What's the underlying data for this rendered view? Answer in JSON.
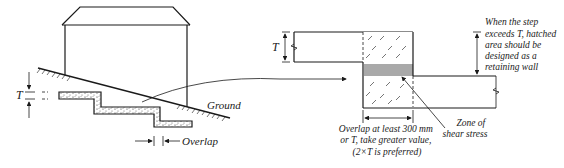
{
  "left_figure": {
    "label_T": "T",
    "label_ground": "Ground",
    "label_overlap": "Overlap"
  },
  "right_figure": {
    "label_T": "T",
    "note_step": [
      "When the step",
      "exceeds T, hatched",
      "area should be",
      "designed as a",
      "retaining wall"
    ],
    "note_overlap": [
      "Overlap at least 300 mm",
      "or T, take greater value,",
      "(2×T is preferred)"
    ],
    "note_shear": [
      "Zone of",
      "shear stress"
    ]
  },
  "colors": {
    "line": "#1a1a1a",
    "shear_zone": "#8c8c8c",
    "background": "#ffffff"
  }
}
